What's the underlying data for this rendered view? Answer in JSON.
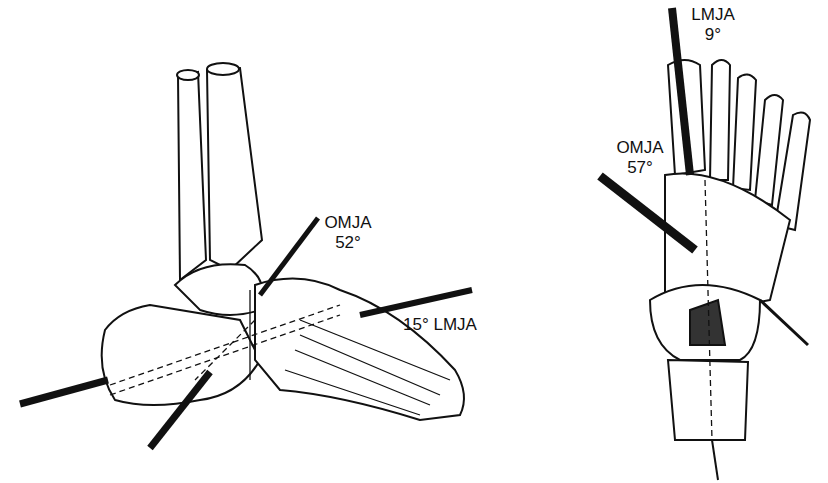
{
  "figures": [
    {
      "id": "lateral-view",
      "labels": {
        "omja_name": "OMJA",
        "omja_angle": "52°",
        "lmja": "15° LMJA"
      }
    },
    {
      "id": "dorsal-view",
      "labels": {
        "lmja_name": "LMJA",
        "lmja_angle": "9°",
        "omja_name": "OMJA",
        "omja_angle": "57°"
      }
    }
  ]
}
